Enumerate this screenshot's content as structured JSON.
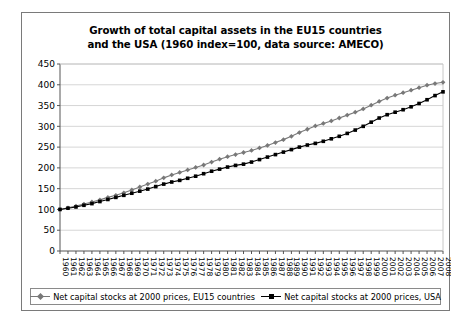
{
  "chart_data": {
    "type": "line",
    "title": "Growth of total capital assets in the EU15 countries and the USA (1960 index=100, data source: AMECO)",
    "title_line1": "Growth of total capital assets in the EU15 countries",
    "title_line2": "and the USA (1960 index=100, data source: AMECO)",
    "xlabel": "",
    "ylabel": "",
    "ylim": [
      0,
      450
    ],
    "ytick_step": 50,
    "yticks": [
      0,
      50,
      100,
      150,
      200,
      250,
      300,
      350,
      400,
      450
    ],
    "grid": true,
    "legend_position": "bottom",
    "x": [
      1960,
      1961,
      1962,
      1963,
      1964,
      1965,
      1966,
      1967,
      1968,
      1969,
      1970,
      1971,
      1972,
      1973,
      1974,
      1975,
      1976,
      1977,
      1978,
      1979,
      1980,
      1981,
      1982,
      1983,
      1984,
      1985,
      1986,
      1987,
      1988,
      1989,
      1990,
      1991,
      1992,
      1993,
      1994,
      1995,
      1996,
      1997,
      1998,
      1999,
      2000,
      2001,
      2002,
      2003,
      2004,
      2005,
      2006,
      2007,
      2008
    ],
    "series": [
      {
        "name": "Net capital stocks at 2000 prices, EU15 countries",
        "marker": "diamond",
        "color": "#787878",
        "values": [
          100,
          104,
          108,
          113,
          118,
          123,
          129,
          134,
          140,
          147,
          154,
          161,
          168,
          176,
          183,
          189,
          195,
          201,
          207,
          214,
          221,
          227,
          232,
          237,
          242,
          248,
          254,
          261,
          268,
          276,
          285,
          293,
          301,
          307,
          313,
          320,
          327,
          334,
          342,
          351,
          360,
          368,
          375,
          381,
          387,
          393,
          399,
          403,
          406
        ]
      },
      {
        "name": "Net capital stocks at 2000 prices, USA",
        "marker": "square",
        "color": "#000000",
        "values": [
          100,
          103,
          106,
          110,
          114,
          119,
          124,
          129,
          134,
          139,
          144,
          149,
          155,
          161,
          166,
          170,
          175,
          180,
          186,
          192,
          197,
          202,
          206,
          209,
          214,
          220,
          226,
          232,
          238,
          244,
          250,
          255,
          259,
          264,
          270,
          276,
          283,
          291,
          300,
          310,
          320,
          328,
          334,
          340,
          347,
          355,
          364,
          374,
          383
        ]
      }
    ]
  },
  "legend": {
    "items": [
      {
        "label": "Net capital stocks at 2000 prices, EU15 countries",
        "marker": "diamond-marker",
        "color": "#787878"
      },
      {
        "label": "Net capital stocks at 2000 prices, USA",
        "marker": "square-marker",
        "color": "#000000"
      }
    ]
  }
}
